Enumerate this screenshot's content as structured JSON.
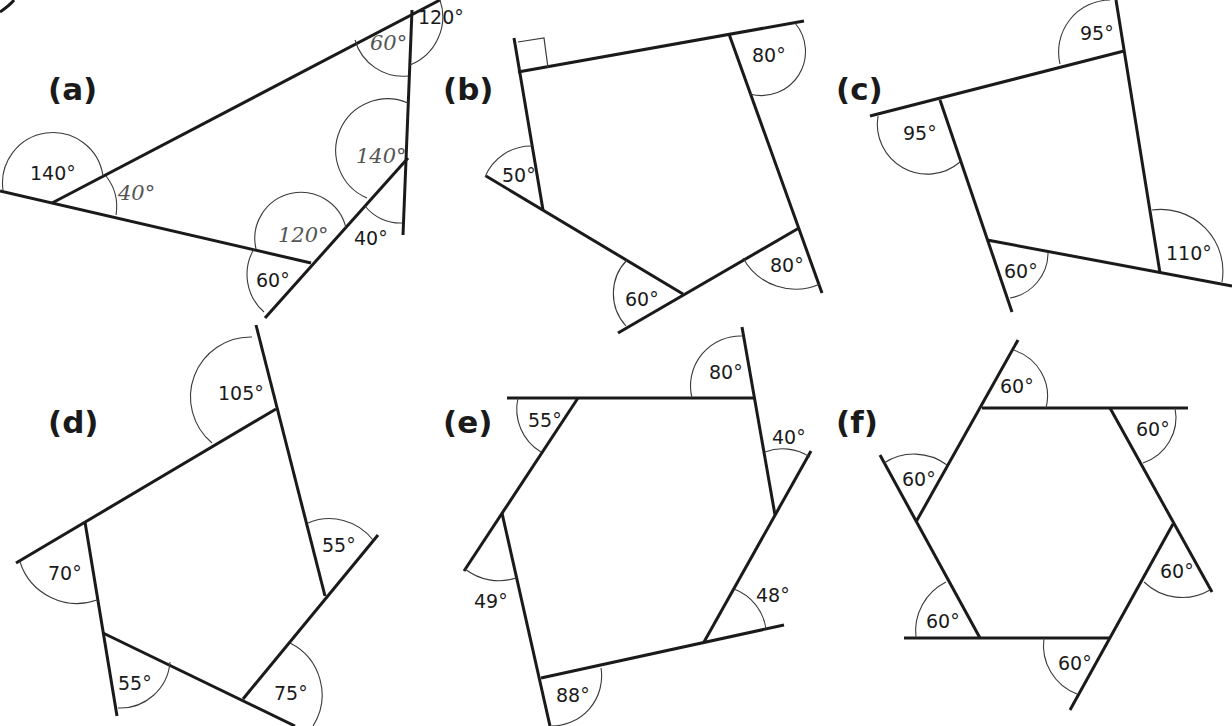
{
  "panels": {
    "a": {
      "label": "(a)",
      "angles": {
        "top_right_outer": "120°",
        "left_outer": "140°",
        "bottom_outer": "60°",
        "right_outer": "40°"
      },
      "handwritten": {
        "top_interior": "60°",
        "left_interior": "40°",
        "bottom_interior": "120°",
        "right_interior": "140°"
      }
    },
    "b": {
      "label": "(b)",
      "right_angle_marker": true,
      "angles": {
        "top_right": "80°",
        "left": "50°",
        "bottom": "60°",
        "bottom_right": "80°"
      }
    },
    "c": {
      "label": "(c)",
      "angles": {
        "top": "95°",
        "left": "95°",
        "bottom": "60°",
        "right": "110°"
      }
    },
    "d": {
      "label": "(d)",
      "angles": {
        "top": "105°",
        "right": "55°",
        "left": "70°",
        "bottom_left": "55°",
        "bottom_right": "75°"
      }
    },
    "e": {
      "label": "(e)",
      "angles": {
        "top_left": "55°",
        "top_right": "80°",
        "right_upper": "40°",
        "left": "49°",
        "right_lower": "48°",
        "bottom": "88°"
      }
    },
    "f": {
      "label": "(f)",
      "angles": {
        "top": "60°",
        "top_right": "60°",
        "left": "60°",
        "right": "60°",
        "bottom_left": "60°",
        "bottom": "60°"
      }
    }
  }
}
